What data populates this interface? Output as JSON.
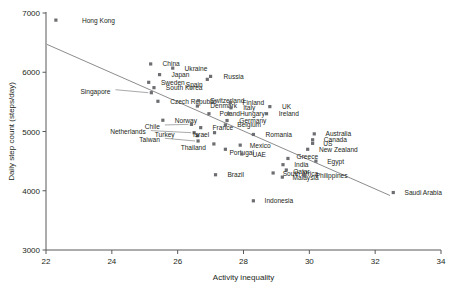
{
  "chart_data": {
    "type": "scatter",
    "title": "",
    "xlabel": "Activity inequality",
    "ylabel": "Daily step count (steps/day)",
    "xlim": [
      22,
      34
    ],
    "ylim": [
      3000,
      7000
    ],
    "xticks": [
      22,
      24,
      26,
      28,
      30,
      32,
      34
    ],
    "yticks": [
      3000,
      4000,
      5000,
      6000,
      7000
    ],
    "grid": false,
    "legend": null,
    "marker_color": "#6d6e71",
    "trendline": {
      "label": "linear fit",
      "color": "#8c8c8c",
      "x": [
        22.03,
        32.45
      ],
      "y": [
        6470,
        3920
      ]
    },
    "points": [
      {
        "label": "Hong Kong",
        "x": 22.3,
        "y": 6880,
        "lx": 23.0,
        "ly": 6880
      },
      {
        "label": "China",
        "x": 25.18,
        "y": 6140,
        "lx": 25.45,
        "ly": 6140
      },
      {
        "label": "Ukraine",
        "x": 25.85,
        "y": 6070,
        "lx": 26.12,
        "ly": 6070
      },
      {
        "label": "Japan",
        "x": 25.45,
        "y": 5960,
        "lx": 25.72,
        "ly": 5960
      },
      {
        "label": "Russia",
        "x": 27.0,
        "y": 5930,
        "lx": 27.3,
        "ly": 5930
      },
      {
        "label": "Spain",
        "x": 26.9,
        "y": 5880,
        "lx": 26.85,
        "ly": 5800
      },
      {
        "label": "Sweden",
        "x": 25.12,
        "y": 5830,
        "lx": 25.4,
        "ly": 5830
      },
      {
        "label": "South Korea",
        "x": 25.28,
        "y": 5740,
        "lx": 25.55,
        "ly": 5740
      },
      {
        "label": "Singapore",
        "x": 25.2,
        "y": 5655,
        "lx": 24.05,
        "ly": 5680
      },
      {
        "label": "Czech Republic",
        "x": 25.4,
        "y": 5510,
        "lx": 25.68,
        "ly": 5510
      },
      {
        "label": "Switzerland",
        "x": 26.63,
        "y": 5520,
        "lx": 26.9,
        "ly": 5520
      },
      {
        "label": "Denmark",
        "x": 26.6,
        "y": 5430,
        "lx": 26.9,
        "ly": 5440
      },
      {
        "label": "Finland",
        "x": 27.6,
        "y": 5490,
        "lx": 27.88,
        "ly": 5490
      },
      {
        "label": "Italy",
        "x": 27.62,
        "y": 5400,
        "lx": 27.9,
        "ly": 5400
      },
      {
        "label": "UK",
        "x": 28.8,
        "y": 5420,
        "lx": 29.08,
        "ly": 5420
      },
      {
        "label": "Ireland",
        "x": 28.7,
        "y": 5300,
        "lx": 28.98,
        "ly": 5300
      },
      {
        "label": "Poland",
        "x": 26.95,
        "y": 5300,
        "lx": 27.18,
        "ly": 5295
      },
      {
        "label": "Hungary",
        "x": 27.55,
        "y": 5300,
        "lx": 27.8,
        "ly": 5300
      },
      {
        "label": "Germany",
        "x": 27.5,
        "y": 5185,
        "lx": 27.78,
        "ly": 5185
      },
      {
        "label": "Belgium",
        "x": 27.45,
        "y": 5110,
        "lx": 27.72,
        "ly": 5110
      },
      {
        "label": "Norway",
        "x": 25.55,
        "y": 5190,
        "lx": 25.82,
        "ly": 5190
      },
      {
        "label": "Chile",
        "x": 26.42,
        "y": 5120,
        "lx": 25.55,
        "ly": 5085
      },
      {
        "label": "France",
        "x": 26.7,
        "y": 5065,
        "lx": 26.97,
        "ly": 5065
      },
      {
        "label": "Netherlands",
        "x": 26.5,
        "y": 4980,
        "lx": 25.12,
        "ly": 4990
      },
      {
        "label": "Turkey",
        "x": 26.6,
        "y": 4930,
        "lx": 26.0,
        "ly": 4945
      },
      {
        "label": "Israel",
        "x": 27.12,
        "y": 4980,
        "lx": 27.05,
        "ly": 4945
      },
      {
        "label": "Taiwan",
        "x": 26.62,
        "y": 4840,
        "lx": 25.55,
        "ly": 4860
      },
      {
        "label": "Romania",
        "x": 28.3,
        "y": 4950,
        "lx": 28.58,
        "ly": 4950
      },
      {
        "label": "Thailand",
        "x": 27.1,
        "y": 4790,
        "lx": 26.95,
        "ly": 4720
      },
      {
        "label": "Mexico",
        "x": 27.9,
        "y": 4770,
        "lx": 28.1,
        "ly": 4760
      },
      {
        "label": "Portugal",
        "x": 27.45,
        "y": 4700,
        "lx": 27.48,
        "ly": 4650
      },
      {
        "label": "UAE",
        "x": 27.95,
        "y": 4620,
        "lx": 28.18,
        "ly": 4615
      },
      {
        "label": "Australia",
        "x": 30.15,
        "y": 4960,
        "lx": 30.4,
        "ly": 4960
      },
      {
        "label": "Canada",
        "x": 30.1,
        "y": 4860,
        "lx": 30.35,
        "ly": 4865
      },
      {
        "label": "US",
        "x": 30.1,
        "y": 4800,
        "lx": 30.33,
        "ly": 4795
      },
      {
        "label": "New Zealand",
        "x": 29.95,
        "y": 4700,
        "lx": 30.2,
        "ly": 4700
      },
      {
        "label": "Greece",
        "x": 29.35,
        "y": 4545,
        "lx": 29.52,
        "ly": 4570
      },
      {
        "label": "Egypt",
        "x": 30.2,
        "y": 4500,
        "lx": 30.45,
        "ly": 4500
      },
      {
        "label": "India",
        "x": 29.2,
        "y": 4440,
        "lx": 29.45,
        "ly": 4440
      },
      {
        "label": "Qatar",
        "x": 29.3,
        "y": 4350,
        "lx": 29.42,
        "ly": 4330
      },
      {
        "label": "South Africa",
        "x": 28.9,
        "y": 4300,
        "lx": 29.1,
        "ly": 4285
      },
      {
        "label": "Malaysia",
        "x": 29.18,
        "y": 4230,
        "lx": 29.4,
        "ly": 4225
      },
      {
        "label": "Philippines",
        "x": 29.85,
        "y": 4250,
        "lx": 30.1,
        "ly": 4250
      },
      {
        "label": "Brazil",
        "x": 27.15,
        "y": 4270,
        "lx": 27.42,
        "ly": 4270
      },
      {
        "label": "Indonesia",
        "x": 28.3,
        "y": 3830,
        "lx": 28.55,
        "ly": 3830
      },
      {
        "label": "Saudi Arabia",
        "x": 32.55,
        "y": 3970,
        "lx": 32.8,
        "ly": 3970
      }
    ]
  }
}
